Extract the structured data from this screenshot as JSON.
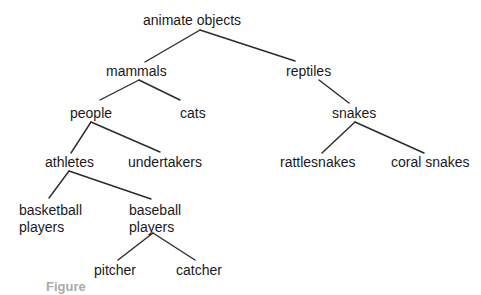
{
  "diagram": {
    "type": "tree",
    "nodes": [
      {
        "id": "animate_objects",
        "label": "animate objects",
        "parent": null
      },
      {
        "id": "mammals",
        "label": "mammals",
        "parent": "animate_objects"
      },
      {
        "id": "reptiles",
        "label": "reptiles",
        "parent": "animate_objects"
      },
      {
        "id": "people",
        "label": "people",
        "parent": "mammals"
      },
      {
        "id": "cats",
        "label": "cats",
        "parent": "mammals"
      },
      {
        "id": "snakes",
        "label": "snakes",
        "parent": "reptiles"
      },
      {
        "id": "athletes",
        "label": "athletes",
        "parent": "people"
      },
      {
        "id": "undertakers",
        "label": "undertakers",
        "parent": "people"
      },
      {
        "id": "rattlesnakes",
        "label": "rattlesnakes",
        "parent": "snakes"
      },
      {
        "id": "coral_snakes",
        "label": "coral snakes",
        "parent": "snakes"
      },
      {
        "id": "basketball_players",
        "label": "basketball\nplayers",
        "parent": "athletes"
      },
      {
        "id": "baseball_players",
        "label": "baseball\nplayers",
        "parent": "athletes"
      },
      {
        "id": "pitcher",
        "label": "pitcher",
        "parent": "baseball_players"
      },
      {
        "id": "catcher",
        "label": "catcher",
        "parent": "baseball_players"
      }
    ],
    "caption": "Figure"
  }
}
